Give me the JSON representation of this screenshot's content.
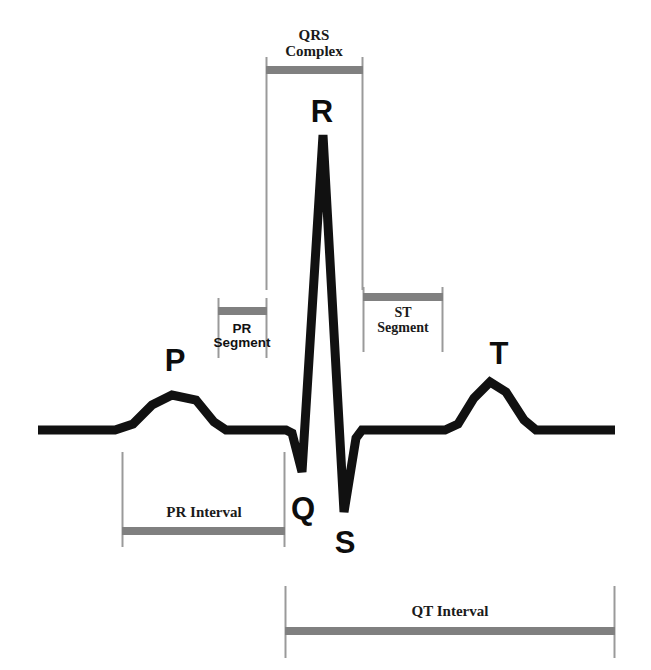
{
  "figure": {
    "background_color": "#ffffff",
    "trace_color": "#111111",
    "bracket_bar_color": "#808080",
    "bracket_line_color": "#9a9a9a"
  },
  "wave_letters": [
    {
      "id": "p",
      "label": "P",
      "x": 175,
      "y": 345
    },
    {
      "id": "r",
      "label": "R",
      "x": 322,
      "y": 96
    },
    {
      "id": "q",
      "label": "Q",
      "x": 303,
      "y": 493
    },
    {
      "id": "s",
      "label": "S",
      "x": 345,
      "y": 527
    },
    {
      "id": "t",
      "label": "T",
      "x": 499,
      "y": 338
    }
  ],
  "brackets": [
    {
      "id": "qrs-complex",
      "label_line1": "QRS",
      "label_line2": "Complex",
      "label_style": "serif",
      "x_start": 266,
      "x_end": 363,
      "bar_y": 70,
      "tick_top": 57,
      "tick_bottom": 290,
      "label_y": 28
    },
    {
      "id": "pr-segment",
      "label_line1": "PR",
      "label_line2": "Segment",
      "label_style": "sans",
      "x_start": 218,
      "x_end": 266,
      "bar_y": 311,
      "tick_top": 298,
      "tick_bottom": 358,
      "label_y": 322
    },
    {
      "id": "st-segment",
      "label_line1": "ST",
      "label_line2": "Segment",
      "label_style": "serif",
      "x_start": 363,
      "x_end": 443,
      "bar_y": 297,
      "tick_top": 287,
      "tick_bottom": 352,
      "label_y": 306
    },
    {
      "id": "pr-interval",
      "label_line1": "PR Interval",
      "label_line2": "",
      "label_style": "serif",
      "x_start": 122,
      "x_end": 285,
      "bar_y": 531,
      "tick_top": 452,
      "tick_bottom": 547,
      "label_y": 505
    },
    {
      "id": "qt-interval",
      "label_line1": "QT Interval",
      "label_line2": "",
      "label_style": "serif",
      "x_start": 285,
      "x_end": 615,
      "bar_y": 631,
      "tick_top": 586,
      "tick_bottom": 658,
      "label_y": 604
    }
  ],
  "trace": {
    "baseline_y": 430,
    "x_start": 38,
    "x_end": 615,
    "stroke_width": 9,
    "path": "M 38,430 L 115,430 L 133,424 L 152,405 L 172,395 L 196,400 L 214,422 L 226,430 L 286,430 L 292,433 L 302,472 L 323,135 L 344,512 L 356,438 L 362,430 L 445,430 L 458,424 L 474,398 L 490,382 L 506,392 L 524,420 L 536,430 L 615,430",
    "points": {
      "p_peak": [
        175,
        394
      ],
      "q_trough": [
        302,
        472
      ],
      "r_peak": [
        323,
        135
      ],
      "s_trough": [
        344,
        512
      ],
      "t_peak": [
        490,
        381
      ]
    }
  }
}
